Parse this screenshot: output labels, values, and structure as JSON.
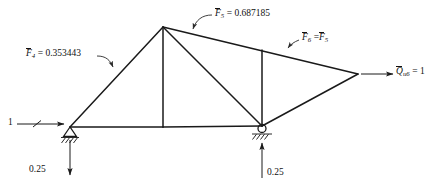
{
  "figure": {
    "background_color": "#ffffff",
    "line_color": "#1a1a1a",
    "width": 437,
    "height": 189
  },
  "labels": {
    "f4": {
      "symbol": "F",
      "subscript": "4",
      "equals": "=",
      "value": "0.353443",
      "full": "F̄4 = 0.353443"
    },
    "f5": {
      "symbol": "F",
      "subscript": "5",
      "equals": "=",
      "value": "0.687185",
      "full": "F̄5 = 0.687185"
    },
    "f6": {
      "symbol": "F",
      "subscript": "6",
      "equals": "=",
      "rhs_symbol": "F",
      "rhs_subscript": "5",
      "full": "F̄6 = F̄5"
    },
    "load_q": {
      "symbol": "Q",
      "subscript": "u6",
      "equals": "=",
      "value": "1",
      "full": "Q̄u6 = 1"
    },
    "applied_unit_load": {
      "value": "1"
    },
    "reaction_left": {
      "value": "0.25"
    },
    "reaction_right": {
      "value": "0.25"
    }
  },
  "nodes": [
    {
      "name": "left-pin-support",
      "x": 70,
      "y": 127,
      "type": "pin"
    },
    {
      "name": "apex",
      "x": 163,
      "y": 27,
      "type": "joint"
    },
    {
      "name": "bottom-mid",
      "x": 163,
      "y": 127,
      "type": "joint"
    },
    {
      "name": "roller-support",
      "x": 262,
      "y": 126,
      "type": "roller"
    },
    {
      "name": "top-right-joint",
      "x": 262,
      "y": 50,
      "type": "joint"
    },
    {
      "name": "right-tip",
      "x": 358,
      "y": 74,
      "type": "joint"
    }
  ],
  "members": [
    {
      "name": "bottom-chord-left",
      "from": "left-pin-support",
      "to": "bottom-mid"
    },
    {
      "name": "bottom-chord-right",
      "from": "bottom-mid",
      "to": "roller-support"
    },
    {
      "name": "left-top-chord",
      "from": "left-pin-support",
      "to": "apex",
      "force_label": "f4"
    },
    {
      "name": "center-vertical",
      "from": "apex",
      "to": "bottom-mid"
    },
    {
      "name": "apex-to-roller-diagonal",
      "from": "apex",
      "to": "roller-support"
    },
    {
      "name": "upper-right-chord",
      "from": "apex",
      "to": "right-tip",
      "force_label": "f5"
    },
    {
      "name": "right-vertical",
      "from": "top-right-joint",
      "to": "roller-support"
    },
    {
      "name": "lower-right-chord",
      "from": "roller-support",
      "to": "right-tip",
      "force_label": "f6"
    }
  ],
  "forces": [
    {
      "name": "applied-unit-load",
      "label": "1",
      "direction": "right",
      "at": "left-pin-support"
    },
    {
      "name": "applied-load-q",
      "label": "Q̄u6 = 1",
      "direction": "right",
      "at": "right-tip"
    },
    {
      "name": "left-reaction",
      "label": "0.25",
      "direction": "down",
      "at": "left-pin-support"
    },
    {
      "name": "right-reaction",
      "label": "0.25",
      "direction": "up",
      "at": "roller-support"
    }
  ]
}
